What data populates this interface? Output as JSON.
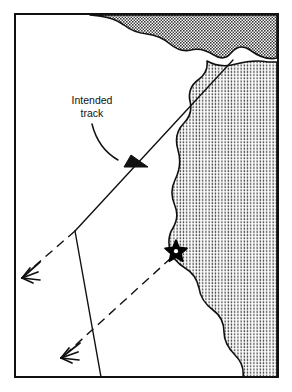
{
  "figure": {
    "name": "navigation-track-diagram",
    "type": "nautical-chart-sketch",
    "background_color": "#ffffff",
    "ink_color": "#111111",
    "border": {
      "name": "chart-frame",
      "x": 15,
      "y": 14,
      "width": 263,
      "height": 363,
      "stroke_width": 2
    }
  },
  "annotations": {
    "intended_track_label": {
      "line1": "Intended",
      "line2": "track",
      "x": 92,
      "y1": 104,
      "y2": 117
    }
  },
  "landmasses": [
    {
      "name": "land-north",
      "fill_pattern": "dense-stipple",
      "fill_tone": "#6e6e6e",
      "description": "Upper coastline shading along top edge"
    },
    {
      "name": "land-east",
      "fill_pattern": "fine-stipple",
      "fill_tone": "#a8a8a8",
      "description": "Eastern landmass with indented bay near the star"
    }
  ],
  "markers": [
    {
      "name": "hazard-star-marker",
      "symbol": "star",
      "points": 5,
      "x": 176,
      "y": 251,
      "radius_outer": 11,
      "radius_inner": 4.2,
      "fill": "#000000"
    }
  ],
  "tracks": [
    {
      "name": "intended-track-line",
      "style": "solid",
      "from_x": 233,
      "from_y": 60,
      "to_x": 75,
      "to_y": 231,
      "stroke_width": 1.4
    },
    {
      "name": "bearing-line-solid",
      "style": "solid",
      "from_x": 75,
      "from_y": 231,
      "to_x": 101,
      "to_y": 377,
      "stroke_width": 1.4
    },
    {
      "name": "dead-reckoning-dashed-upper",
      "style": "dashed",
      "from_x": 75,
      "from_y": 231,
      "to_x": 28,
      "to_y": 272,
      "stroke_width": 1.4,
      "dash": "9 6"
    },
    {
      "name": "dead-reckoning-dashed-lower",
      "style": "dashed",
      "from_x": 171,
      "from_y": 258,
      "to_x": 67,
      "to_y": 353,
      "stroke_width": 1.4,
      "dash": "9 6"
    }
  ],
  "arrows": [
    {
      "name": "intended-track-callout-arrow",
      "style": "curved-solid",
      "tip_x": 147,
      "tip_y": 166,
      "direction": "down-right"
    },
    {
      "name": "dr-arrowhead-upper-left",
      "style": "feathered-double-barb",
      "tip_x": 22,
      "tip_y": 278,
      "direction": "down-left"
    },
    {
      "name": "dr-arrowhead-lower-left",
      "style": "feathered-double-barb",
      "tip_x": 61,
      "tip_y": 358,
      "direction": "down-left"
    }
  ]
}
